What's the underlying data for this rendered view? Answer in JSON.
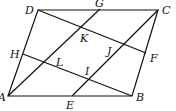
{
  "diagram": {
    "type": "geometry",
    "points": {
      "A": {
        "label": "A",
        "x": 8,
        "y": 96
      },
      "B": {
        "label": "B",
        "x": 132,
        "y": 96
      },
      "C": {
        "label": "C",
        "x": 158,
        "y": 10
      },
      "D": {
        "label": "D",
        "x": 38,
        "y": 10
      },
      "E": {
        "label": "E",
        "x": 72,
        "y": 96
      },
      "F": {
        "label": "F",
        "x": 146,
        "y": 53
      },
      "G": {
        "label": "G",
        "x": 100,
        "y": 9
      },
      "H": {
        "label": "H",
        "x": 23,
        "y": 54
      },
      "K": {
        "label": "K"
      },
      "J": {
        "label": "J"
      },
      "L": {
        "label": "L"
      },
      "I": {
        "label": "I"
      }
    },
    "segments": [
      "AB",
      "BC",
      "CD",
      "DA",
      "AG",
      "EC",
      "DF",
      "HB"
    ]
  }
}
